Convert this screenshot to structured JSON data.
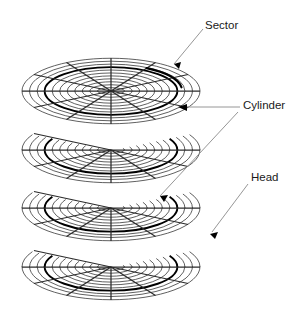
{
  "diagram": {
    "background_color": "#ffffff",
    "ink_color": "#2b2b2b",
    "bold_color": "#000000",
    "leader_color": "#8a8a8a",
    "labels": [
      {
        "id": "sector",
        "text": "Sector",
        "x": 205,
        "y": 26
      },
      {
        "id": "cylinder",
        "text": "Cylinder",
        "x": 243,
        "y": 106
      },
      {
        "id": "head",
        "text": "Head",
        "x": 251,
        "y": 178
      }
    ],
    "platters": {
      "count": 4,
      "center_x": 111,
      "center_ys": [
        91,
        150,
        208,
        267
      ],
      "outer_rx": 89,
      "outer_ry": 33,
      "ring_count": 11,
      "inner_rx": 6,
      "sector_spokes": 12,
      "highlight_ring_index": 8
    },
    "annotations": {
      "sector_arc_deg": [
        300,
        352
      ],
      "cylinder_ring_index": 8,
      "head_arrow_target_platter": 4
    }
  }
}
